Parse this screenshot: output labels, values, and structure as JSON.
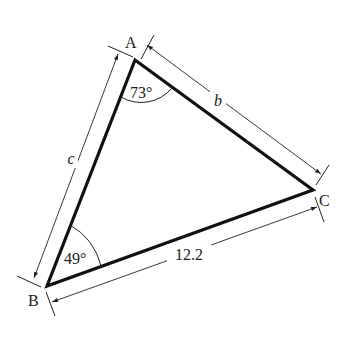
{
  "figure": {
    "vertices": {
      "A": "A",
      "B": "B",
      "C": "C"
    },
    "angles": {
      "A": "73°",
      "B": "49°"
    },
    "sides": {
      "b": "b",
      "c": "c",
      "a": "12.2"
    },
    "colors": {
      "lines": "#111111",
      "background": "#ffffff"
    }
  }
}
